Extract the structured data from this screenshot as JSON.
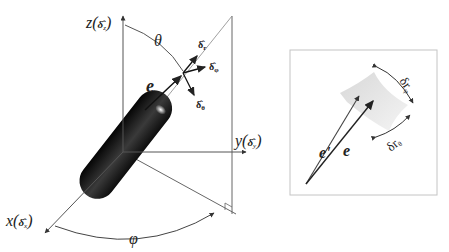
{
  "main_figure": {
    "axes": {
      "z": {
        "var": "z",
        "unit": "δ̂",
        "sub": "z"
      },
      "y": {
        "var": "y",
        "unit": "δ̂",
        "sub": "y"
      },
      "x": {
        "var": "x",
        "unit": "δ̂",
        "sub": "x"
      }
    },
    "angles": {
      "polar": "θ",
      "azimuth": "φ"
    },
    "vector": "e",
    "local_basis": [
      {
        "sym": "δ̂",
        "sub": "r"
      },
      {
        "sym": "δ̂",
        "sub": "φ"
      },
      {
        "sym": "δ̂",
        "sub": "θ"
      }
    ]
  },
  "inset": {
    "vectors": [
      "e'",
      "e"
    ],
    "displacements": [
      {
        "sym": "δr",
        "sub": "φ"
      },
      {
        "sym": "δr",
        "sub": "θ"
      }
    ]
  },
  "colors": {
    "line": "#555555",
    "arrow": "#222222",
    "frame": "#bbbbbb",
    "patch": "#e2e2e2"
  }
}
